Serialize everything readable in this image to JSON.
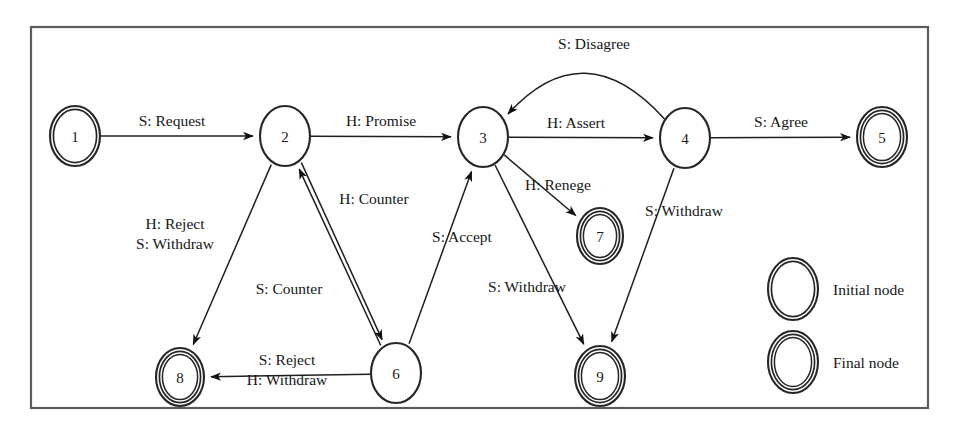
{
  "figure": {
    "kind": "state-transition-diagram",
    "border_color": "#5b5b5b",
    "stroke_color": "#1f1f1f",
    "background": "#ffffff"
  },
  "nodes": [
    {
      "id": "1",
      "label": "1",
      "kind": "initial",
      "rings": 2,
      "cx": 75,
      "cy": 136,
      "rx": 25,
      "ry": 30
    },
    {
      "id": "2",
      "label": "2",
      "kind": "plain",
      "rings": 1,
      "cx": 285,
      "cy": 136,
      "rx": 25,
      "ry": 30
    },
    {
      "id": "3",
      "label": "3",
      "kind": "plain",
      "rings": 1,
      "cx": 483,
      "cy": 137,
      "rx": 25,
      "ry": 30
    },
    {
      "id": "4",
      "label": "4",
      "kind": "plain",
      "rings": 1,
      "cx": 685,
      "cy": 138,
      "rx": 25,
      "ry": 30
    },
    {
      "id": "5",
      "label": "5",
      "kind": "final",
      "rings": 3,
      "cx": 882,
      "cy": 137,
      "rx": 25,
      "ry": 30
    },
    {
      "id": "6",
      "label": "6",
      "kind": "plain",
      "rings": 1,
      "cx": 396,
      "cy": 373,
      "rx": 25,
      "ry": 30
    },
    {
      "id": "7",
      "label": "7",
      "kind": "final",
      "rings": 3,
      "cx": 600,
      "cy": 236,
      "rx": 23,
      "ry": 28
    },
    {
      "id": "8",
      "label": "8",
      "kind": "final",
      "rings": 3,
      "cx": 180,
      "cy": 377,
      "rx": 24,
      "ry": 29
    },
    {
      "id": "9",
      "label": "9",
      "kind": "final",
      "rings": 3,
      "cx": 600,
      "cy": 376,
      "rx": 25,
      "ry": 30
    }
  ],
  "edges": [
    {
      "id": "e1",
      "from": "1",
      "to": "2",
      "label": "S: Request",
      "label_x": 172,
      "label_y": 126
    },
    {
      "id": "e2",
      "from": "2",
      "to": "3",
      "label": "H: Promise",
      "label_x": 381,
      "label_y": 126
    },
    {
      "id": "e3",
      "from": "3",
      "to": "4",
      "label": "H: Assert",
      "label_x": 576,
      "label_y": 128
    },
    {
      "id": "e4",
      "from": "4",
      "to": "5",
      "label": "S: Agree",
      "label_x": 781,
      "label_y": 127
    },
    {
      "id": "e5",
      "from": "4",
      "to": "3",
      "label": "S: Disagree",
      "label_x": 594,
      "label_y": 49
    },
    {
      "id": "e6",
      "from": "2",
      "to": "6",
      "label": "H: Counter",
      "label_x": 374,
      "label_y": 204
    },
    {
      "id": "e7",
      "from": "6",
      "to": "2",
      "label": "S: Counter",
      "label_x": 289,
      "label_y": 294
    },
    {
      "id": "e8",
      "from": "2",
      "to": "8",
      "label_lines": [
        "H: Reject",
        "S: Withdraw"
      ],
      "label_x": 175,
      "label_y": 238
    },
    {
      "id": "e9",
      "from": "6",
      "to": "3",
      "label": "S: Accept",
      "label_x": 462,
      "label_y": 242
    },
    {
      "id": "e10",
      "from": "6",
      "to": "8",
      "label_lines": [
        "S: Reject",
        "H: Withdraw"
      ],
      "label_x": 287,
      "label_y": 374
    },
    {
      "id": "e11",
      "from": "3",
      "to": "7",
      "label": "H: Renege",
      "label_x": 558,
      "label_y": 190
    },
    {
      "id": "e12",
      "from": "3",
      "to": "9",
      "label": "S: Withdraw",
      "label_x": 527,
      "label_y": 292
    },
    {
      "id": "e13",
      "from": "4",
      "to": "9",
      "label": "S: Withdraw",
      "label_x": 684,
      "label_y": 216
    }
  ],
  "legend": {
    "items": [
      {
        "id": "legend-initial",
        "label": "Initial node",
        "rings": 2,
        "cx": 793,
        "cy": 289,
        "rx": 25,
        "ry": 31,
        "label_x": 833,
        "label_y": 289
      },
      {
        "id": "legend-final",
        "label": "Final node",
        "rings": 3,
        "cx": 793,
        "cy": 362,
        "rx": 25,
        "ry": 31,
        "label_x": 833,
        "label_y": 362
      }
    ]
  }
}
